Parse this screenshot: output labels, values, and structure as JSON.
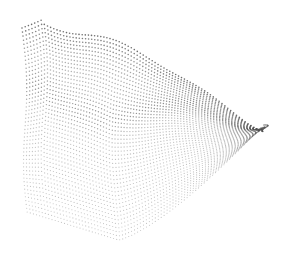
{
  "image": {
    "width": 282,
    "height": 255,
    "background": "#ffffff",
    "subject": "point-cloud-surface",
    "dot_color": "#555555",
    "ridge_color": "#333333",
    "outline": {
      "top_left": [
        22,
        22
      ],
      "peak_left": [
        40,
        14
      ],
      "top_ridge_right": [
        265,
        125
      ],
      "right_tip": [
        265,
        125
      ],
      "bottom_right": [
        200,
        190
      ],
      "bottom": [
        120,
        240
      ],
      "bottom_left": [
        25,
        215
      ]
    }
  }
}
